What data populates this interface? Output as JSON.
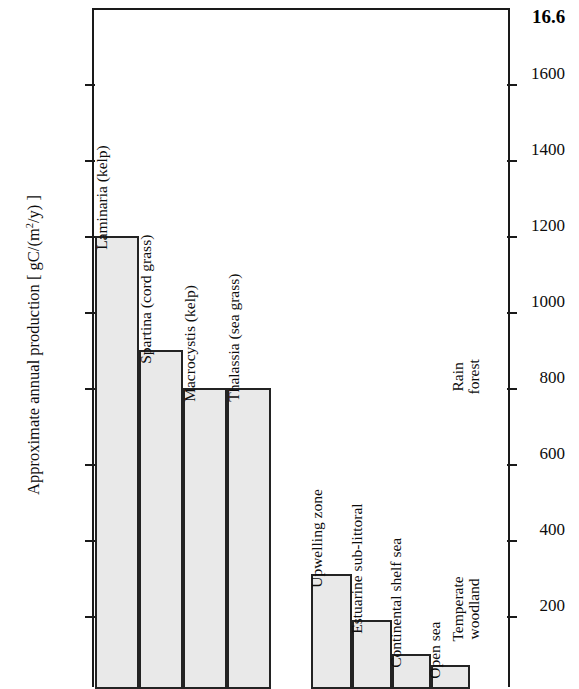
{
  "figure": {
    "number": "16.6"
  },
  "chart_data": {
    "type": "bar",
    "title": "",
    "subtitle": "",
    "xlabel": "",
    "ylabel": "Approximate annual production [ gC/(m²/y) ]",
    "ylabel_parts": {
      "prefix": "Approximate annual production [ gC/(m",
      "exponent": "2",
      "suffix": "/y) ]"
    },
    "ylim": [
      0,
      1750
    ],
    "yticks": [
      200,
      400,
      600,
      800,
      1000,
      1200,
      1400,
      1600
    ],
    "ytick_labels": [
      "200",
      "400",
      "600",
      "800",
      "1000",
      "1200",
      "1400",
      "1600"
    ],
    "grid": false,
    "legend": "none",
    "right_axis_ticks": true,
    "categories": [
      "Laminaria (kelp)",
      "Spartina (cord grass)",
      "Macrocystis (kelp)",
      "Thalassia (sea grass)",
      "Upwelling zone",
      "Estuarine sub-littoral",
      "Continental shelf sea",
      "Open sea"
    ],
    "values": [
      1200,
      900,
      800,
      800,
      310,
      190,
      100,
      70
    ],
    "bars": [
      {
        "label": "Laminaria (kelp)",
        "value": 1200,
        "group": "coastal-plants"
      },
      {
        "label": "Spartina (cord grass)",
        "value": 900,
        "group": "coastal-plants"
      },
      {
        "label": "Macrocystis (kelp)",
        "value": 800,
        "group": "coastal-plants"
      },
      {
        "label": "Thalassia (sea grass)",
        "value": 800,
        "group": "coastal-plants"
      },
      {
        "label": "Upwelling zone",
        "value": 310,
        "group": "ocean-systems"
      },
      {
        "label": "Estuarine sub-littoral",
        "value": 190,
        "group": "ocean-systems"
      },
      {
        "label": "Continental shelf sea",
        "value": 100,
        "group": "ocean-systems"
      },
      {
        "label": "Open sea",
        "value": 70,
        "group": "ocean-systems"
      }
    ],
    "annotations": [
      {
        "text_line1": "Rain",
        "text_line2": "forest",
        "label": "Rain forest"
      },
      {
        "text_line1": "Temperate",
        "text_line2": "woodland",
        "label": "Temperate woodland"
      }
    ],
    "colors": {
      "bar_fill": "#e9e9e9",
      "bar_stroke": "#232323",
      "axis": "#1a1a1a",
      "text": "#0d0d0d",
      "background": "#ffffff"
    }
  }
}
